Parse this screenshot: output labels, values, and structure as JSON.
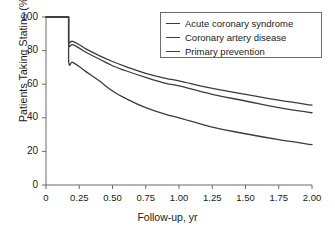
{
  "chart_data": {
    "type": "line",
    "title": "",
    "xlabel": "Follow-up, yr",
    "ylabel": "Patients Taking Statins (%)",
    "xlim": [
      0,
      2.0
    ],
    "ylim": [
      0,
      100
    ],
    "grid": false,
    "legend_position": "upper-right",
    "xticks": [
      "0",
      "0.25",
      "0.50",
      "0.75",
      "1.00",
      "1.25",
      "1.50",
      "1.75",
      "2.00"
    ],
    "xtick_values": [
      0,
      0.25,
      0.5,
      0.75,
      1.0,
      1.25,
      1.5,
      1.75,
      2.0
    ],
    "yticks": [
      "0",
      "20",
      "40",
      "60",
      "80",
      "100"
    ],
    "ytick_values": [
      0,
      20,
      40,
      60,
      80,
      100
    ],
    "line_color": "#3c3c3c",
    "axis_color": "#6b6b6b",
    "series": [
      {
        "name": "Acute coronary syndrome",
        "x": [
          0,
          0.17,
          0.17,
          0.2,
          0.25,
          0.3,
          0.4,
          0.5,
          0.6,
          0.75,
          0.9,
          1.0,
          1.25,
          1.5,
          1.75,
          2.0
        ],
        "values": [
          100,
          100,
          86,
          85.5,
          83.5,
          81,
          77,
          73.5,
          70.5,
          66.5,
          63.5,
          62,
          57.5,
          54,
          50.5,
          47.5
        ]
      },
      {
        "name": "Coronary artery disease",
        "x": [
          0,
          0.17,
          0.17,
          0.2,
          0.25,
          0.3,
          0.4,
          0.5,
          0.6,
          0.75,
          0.9,
          1.0,
          1.25,
          1.5,
          1.75,
          2.0
        ],
        "values": [
          100,
          100,
          84,
          83.5,
          81.5,
          79,
          75,
          71,
          68,
          64,
          60.5,
          59,
          54,
          50,
          46,
          43
        ]
      },
      {
        "name": "Primary prevention",
        "x": [
          0,
          0.17,
          0.17,
          0.2,
          0.25,
          0.3,
          0.4,
          0.5,
          0.6,
          0.75,
          0.9,
          1.0,
          1.25,
          1.5,
          1.75,
          2.0
        ],
        "values": [
          100,
          100,
          74,
          73,
          70.5,
          67.5,
          62,
          56,
          51.5,
          46,
          42,
          40,
          34.5,
          30.5,
          27,
          24
        ]
      }
    ]
  },
  "legend": {
    "items": [
      {
        "label": "Acute coronary syndrome"
      },
      {
        "label": "Coronary artery disease"
      },
      {
        "label": "Primary prevention"
      }
    ]
  }
}
